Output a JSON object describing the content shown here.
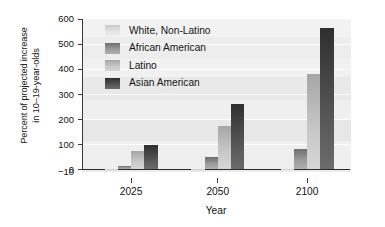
{
  "chart_data": {
    "type": "bar",
    "title": "",
    "xlabel": "Year",
    "ylabel_line1": "Percent of projected increase",
    "ylabel_line2": "in 10–19-year-olds",
    "categories": [
      "2025",
      "2050",
      "2100"
    ],
    "yticks": [
      "600",
      "500",
      "400",
      "300",
      "200",
      "100",
      "0",
      "−10"
    ],
    "ylim": [
      -10,
      600
    ],
    "grid": true,
    "legend_position": "upper-left-inside",
    "series": [
      {
        "name": "White, Non-Latino",
        "color": "#d8d8d8",
        "values": [
          -10,
          -10,
          -5
        ]
      },
      {
        "name": "African American",
        "color": "#8a8a8a",
        "values": [
          15,
          48,
          80
        ]
      },
      {
        "name": "Latino",
        "color": "#bfbfbf",
        "values": [
          75,
          172,
          380
        ]
      },
      {
        "name": "Asian American",
        "color": "#414141",
        "values": [
          98,
          260,
          565
        ]
      }
    ]
  }
}
